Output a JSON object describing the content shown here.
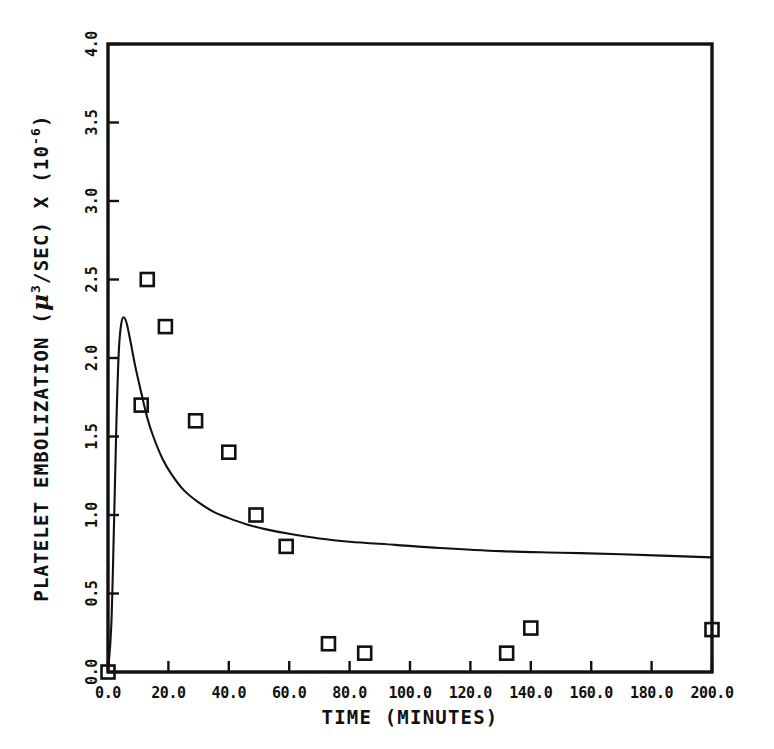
{
  "chart_data": {
    "type": "scatter",
    "title": "",
    "xlabel": "TIME (MINUTES)",
    "ylabel_parts": {
      "lead": "PLATELET EMBOLIZATION (",
      "mu": "μ",
      "mu_sup": "3",
      "mid": "/SEC) X (10",
      "exp_sup": "-6",
      "tail": ")"
    },
    "ylabel": "PLATELET EMBOLIZATION ( μ3/SEC) X (10-6 )",
    "xlim": [
      0.0,
      200.0
    ],
    "ylim": [
      0.0,
      4.0
    ],
    "xticks": [
      "0.0",
      "20.0",
      "40.0",
      "60.0",
      "80.0",
      "100.0",
      "120.0",
      "140.0",
      "160.0",
      "180.0",
      "200.0"
    ],
    "xtick_values": [
      0,
      20,
      40,
      60,
      80,
      100,
      120,
      140,
      160,
      180,
      200
    ],
    "yticks": [
      "0.0",
      "0.5",
      "1.0",
      "1.5",
      "2.0",
      "2.5",
      "3.0",
      "3.5",
      "4.0"
    ],
    "ytick_values": [
      0.0,
      0.5,
      1.0,
      1.5,
      2.0,
      2.5,
      3.0,
      3.5,
      4.0
    ],
    "grid": false,
    "legend": null,
    "series": [
      {
        "name": "observed",
        "type": "scatter",
        "marker": "open-square",
        "color": "#111111",
        "points": [
          {
            "x": 0.0,
            "y": 0.0
          },
          {
            "x": 13.0,
            "y": 2.5
          },
          {
            "x": 19.0,
            "y": 2.2
          },
          {
            "x": 11.0,
            "y": 1.7
          },
          {
            "x": 29.0,
            "y": 1.6
          },
          {
            "x": 40.0,
            "y": 1.4
          },
          {
            "x": 49.0,
            "y": 1.0
          },
          {
            "x": 59.0,
            "y": 0.8
          },
          {
            "x": 73.0,
            "y": 0.18
          },
          {
            "x": 85.0,
            "y": 0.12
          },
          {
            "x": 132.0,
            "y": 0.12
          },
          {
            "x": 140.0,
            "y": 0.28
          },
          {
            "x": 200.0,
            "y": 0.27
          }
        ]
      },
      {
        "name": "model-fit",
        "type": "line",
        "color": "#111111",
        "points": [
          {
            "x": 0.0,
            "y": 0.0
          },
          {
            "x": 1.1,
            "y": 0.3
          },
          {
            "x": 2.0,
            "y": 0.95
          },
          {
            "x": 2.8,
            "y": 1.6
          },
          {
            "x": 3.6,
            "y": 2.05
          },
          {
            "x": 4.4,
            "y": 2.22
          },
          {
            "x": 5.2,
            "y": 2.26
          },
          {
            "x": 6.2,
            "y": 2.22
          },
          {
            "x": 7.5,
            "y": 2.1
          },
          {
            "x": 9.0,
            "y": 1.95
          },
          {
            "x": 11.0,
            "y": 1.78
          },
          {
            "x": 13.0,
            "y": 1.62
          },
          {
            "x": 15.0,
            "y": 1.5
          },
          {
            "x": 18.0,
            "y": 1.36
          },
          {
            "x": 21.0,
            "y": 1.26
          },
          {
            "x": 25.0,
            "y": 1.16
          },
          {
            "x": 30.0,
            "y": 1.08
          },
          {
            "x": 35.0,
            "y": 1.02
          },
          {
            "x": 40.0,
            "y": 0.98
          },
          {
            "x": 46.0,
            "y": 0.94
          },
          {
            "x": 52.0,
            "y": 0.91
          },
          {
            "x": 60.0,
            "y": 0.88
          },
          {
            "x": 70.0,
            "y": 0.85
          },
          {
            "x": 80.0,
            "y": 0.83
          },
          {
            "x": 95.0,
            "y": 0.81
          },
          {
            "x": 110.0,
            "y": 0.79
          },
          {
            "x": 130.0,
            "y": 0.77
          },
          {
            "x": 150.0,
            "y": 0.76
          },
          {
            "x": 170.0,
            "y": 0.75
          },
          {
            "x": 200.0,
            "y": 0.73
          }
        ]
      }
    ]
  },
  "figure": {
    "background_color": "#ffffff",
    "axis_color": "#111111",
    "frame": {
      "left": 108,
      "top": 44,
      "right": 712,
      "bottom": 672
    }
  }
}
